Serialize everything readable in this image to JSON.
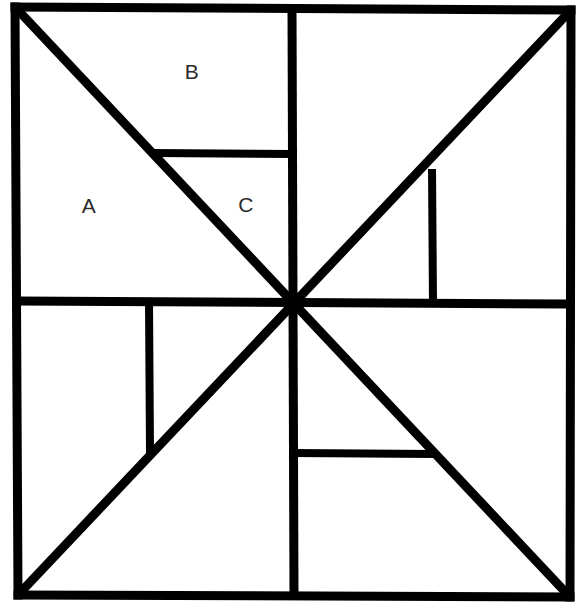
{
  "figure": {
    "background_color": "#ffffff",
    "stroke_color": "#000000",
    "label_color": "#2b2b2b",
    "outer_stroke_width": 9,
    "diagonal_stroke_width": 9,
    "cross_stroke_width": 9,
    "inner_stroke_width": 8
  },
  "geometry": {
    "corners": {
      "top_left": {
        "x": 15,
        "y": 7
      },
      "top_right": {
        "x": 571,
        "y": 10
      },
      "bottom_right": {
        "x": 570,
        "y": 597
      },
      "bottom_left": {
        "x": 18,
        "y": 595
      }
    },
    "center": {
      "x": 293,
      "y": 303
    },
    "cross": {
      "vertical_top": {
        "x": 292,
        "y": 8
      },
      "vertical_bottom": {
        "x": 294,
        "y": 596
      },
      "horizontal_left": {
        "x": 16,
        "y": 301
      },
      "horizontal_right": {
        "x": 570,
        "y": 304
      }
    },
    "diagonals": [
      {
        "name": "main-diagonal-tl-br",
        "x1": 15,
        "y1": 7,
        "x2": 570,
        "y2": 597
      },
      {
        "name": "anti-diagonal-bl-tr",
        "x1": 18,
        "y1": 595,
        "x2": 571,
        "y2": 10
      }
    ],
    "inner_segments": [
      {
        "name": "segment-top-left-horizontal",
        "x1": 154,
        "y1": 153,
        "x2": 291,
        "y2": 154
      },
      {
        "name": "segment-top-right-vertical",
        "x1": 432,
        "y1": 171,
        "x2": 433,
        "y2": 303
      },
      {
        "name": "segment-bottom-left-vertical",
        "x1": 149,
        "y1": 303,
        "x2": 150,
        "y2": 452
      },
      {
        "name": "segment-bottom-right-horizontal",
        "x1": 294,
        "y1": 453,
        "x2": 433,
        "y2": 454
      }
    ]
  },
  "labels": [
    {
      "id": "label-a",
      "text": "A",
      "x": 89,
      "y": 206
    },
    {
      "id": "label-b",
      "text": "B",
      "x": 192,
      "y": 72
    },
    {
      "id": "label-c",
      "text": "C",
      "x": 246,
      "y": 205
    }
  ]
}
